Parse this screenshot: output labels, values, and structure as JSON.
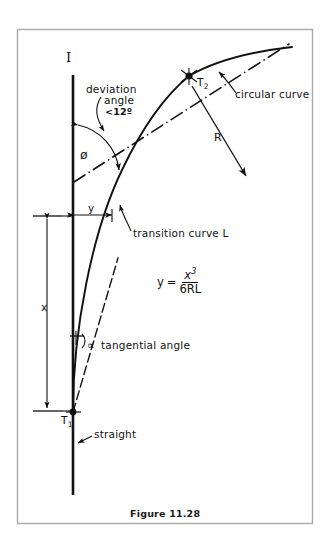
{
  "figure": {
    "caption": "Figure 11.28",
    "border_color": "#a8a8a8",
    "ink_color": "#111111",
    "background": "#ffffff"
  },
  "labels": {
    "intersection": "I",
    "deviation_word": "deviation",
    "angle_word": "angle",
    "angle_limit": "<12º",
    "circular_curve": "circular curve",
    "tangent_point_2": "T",
    "tangent_point_2_sub": "2",
    "radius": "R",
    "phi": "ø",
    "offset_y": "y",
    "transition_curve": "transition curve L",
    "distance_x": "x",
    "alpha": "∝",
    "tangential_angle": "tangential angle",
    "tangent_point_1": "T",
    "tangent_point_1_sub": "1",
    "straight": "straight"
  },
  "formula": {
    "lhs": "y",
    "equals": "=",
    "numerator_base": "x",
    "numerator_exponent": "3",
    "denominator": "6RL"
  },
  "geometry": {
    "straight_line_x": 73,
    "straight_line_top_y": 75,
    "straight_line_bottom_y": 495,
    "T1": [
      73,
      412
    ],
    "T2": [
      189,
      76
    ],
    "radius_arrow_end": [
      246,
      176
    ],
    "x_dimension_from_y": 215,
    "x_dimension_to_y": 412,
    "y_dimension_x_from": 73,
    "y_dimension_x_to": 112
  }
}
